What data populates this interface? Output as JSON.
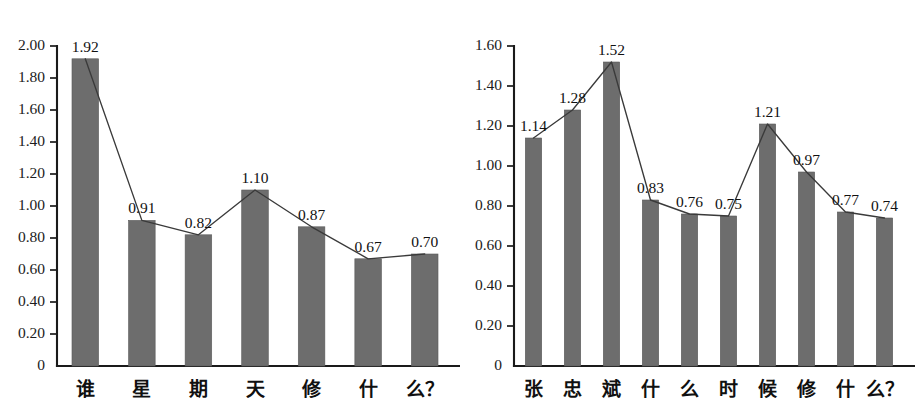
{
  "page": {
    "background_color": "#ffffff",
    "bar_color": "#6d6d6d",
    "line_color": "#3a3a3a",
    "axis_color": "#1a1a1a"
  },
  "chart_data": [
    {
      "id": "left",
      "type": "bar",
      "title": "",
      "subtitle": "",
      "xlabel": "",
      "ylabel": "",
      "grid": false,
      "legend": "none",
      "overlay": "line",
      "ylim": [
        0,
        2.0
      ],
      "ytick_step": 0.2,
      "ytick_labels": [
        "0",
        "0.20",
        "0.40",
        "0.60",
        "0.80",
        "1.00",
        "1.20",
        "1.40",
        "1.60",
        "1.80",
        "2.00"
      ],
      "ytick_values": [
        0,
        0.2,
        0.4,
        0.6,
        0.8,
        1.0,
        1.2,
        1.4,
        1.6,
        1.8,
        2.0
      ],
      "categories": [
        "谁",
        "星",
        "期",
        "天",
        "修",
        "什",
        "么？"
      ],
      "values": [
        1.92,
        0.91,
        0.82,
        1.1,
        0.87,
        0.67,
        0.7
      ],
      "data_labels": [
        "1.92",
        "0.91",
        "0.82",
        "1.10",
        "0.87",
        "0.67",
        "0.70"
      ],
      "series": [
        {
          "name": "bars",
          "values": [
            1.92,
            0.91,
            0.82,
            1.1,
            0.87,
            0.67,
            0.7
          ]
        },
        {
          "name": "trend",
          "values": [
            1.92,
            0.91,
            0.82,
            1.1,
            0.87,
            0.67,
            0.7
          ]
        }
      ]
    },
    {
      "id": "right",
      "type": "bar",
      "title": "",
      "subtitle": "",
      "xlabel": "",
      "ylabel": "",
      "grid": false,
      "legend": "none",
      "overlay": "line",
      "ylim": [
        0,
        1.6
      ],
      "ytick_step": 0.2,
      "ytick_labels": [
        "0",
        "0.20",
        "0.40",
        "0.60",
        "0.80",
        "1.00",
        "1.20",
        "1.40",
        "1.60"
      ],
      "ytick_values": [
        0,
        0.2,
        0.4,
        0.6,
        0.8,
        1.0,
        1.2,
        1.4,
        1.6
      ],
      "categories": [
        "张",
        "忠",
        "斌",
        "什",
        "么",
        "时",
        "候",
        "修",
        "什",
        "么？"
      ],
      "values": [
        1.14,
        1.28,
        1.52,
        0.83,
        0.76,
        0.75,
        1.21,
        0.97,
        0.77,
        0.74
      ],
      "data_labels": [
        "1.14",
        "1.28",
        "1.52",
        "0.83",
        "0.76",
        "0.75",
        "1.21",
        "0.97",
        "0.77",
        "0.74"
      ],
      "series": [
        {
          "name": "bars",
          "values": [
            1.14,
            1.28,
            1.52,
            0.83,
            0.76,
            0.75,
            1.21,
            0.97,
            0.77,
            0.74
          ]
        },
        {
          "name": "trend",
          "values": [
            1.14,
            1.28,
            1.52,
            0.83,
            0.76,
            0.75,
            1.21,
            0.97,
            0.77,
            0.74
          ]
        }
      ]
    }
  ]
}
